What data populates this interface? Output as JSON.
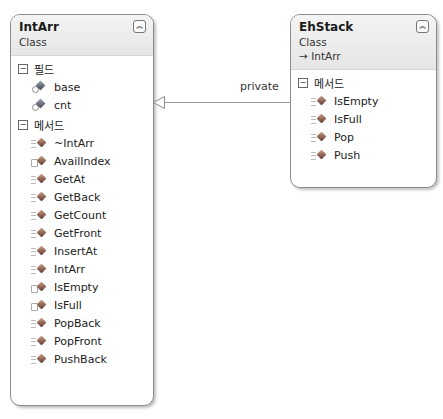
{
  "diagram": {
    "classes": [
      {
        "name": "IntArr",
        "kind": "Class",
        "sections": [
          {
            "title": "필드",
            "members": [
              {
                "name": "base",
                "icon": "private-field-icon"
              },
              {
                "name": "cnt",
                "icon": "private-field-icon"
              }
            ]
          },
          {
            "title": "메서드",
            "members": [
              {
                "name": "~IntArr",
                "icon": "public-method-icon"
              },
              {
                "name": "AvailIndex",
                "icon": "private-method-icon"
              },
              {
                "name": "GetAt",
                "icon": "public-method-icon"
              },
              {
                "name": "GetBack",
                "icon": "public-method-icon"
              },
              {
                "name": "GetCount",
                "icon": "public-method-icon"
              },
              {
                "name": "GetFront",
                "icon": "public-method-icon"
              },
              {
                "name": "InsertAt",
                "icon": "public-method-icon"
              },
              {
                "name": "IntArr",
                "icon": "public-method-icon"
              },
              {
                "name": "IsEmpty",
                "icon": "private-method-icon"
              },
              {
                "name": "IsFull",
                "icon": "private-method-icon"
              },
              {
                "name": "PopBack",
                "icon": "public-method-icon"
              },
              {
                "name": "PopFront",
                "icon": "public-method-icon"
              },
              {
                "name": "PushBack",
                "icon": "public-method-icon"
              }
            ]
          }
        ]
      },
      {
        "name": "EhStack",
        "kind": "Class",
        "base": "→ IntArr",
        "sections": [
          {
            "title": "메서드",
            "members": [
              {
                "name": "IsEmpty",
                "icon": "public-method-icon"
              },
              {
                "name": "IsFull",
                "icon": "public-method-icon"
              },
              {
                "name": "Pop",
                "icon": "public-method-icon"
              },
              {
                "name": "Push",
                "icon": "public-method-icon"
              }
            ]
          }
        ]
      }
    ],
    "relationship": {
      "type": "inheritance",
      "from": "EhStack",
      "to": "IntArr",
      "label": "private"
    },
    "collapse_glyph": "≈",
    "section_toggle_glyph": "−"
  }
}
